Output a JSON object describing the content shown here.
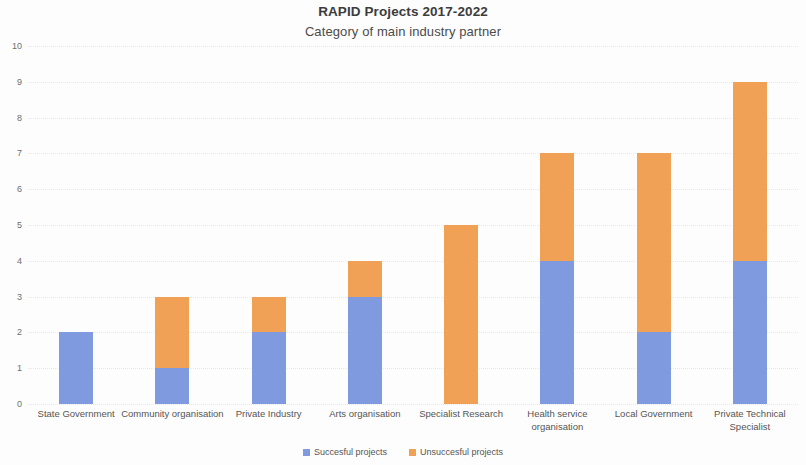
{
  "chart_data": {
    "type": "bar",
    "title": "RAPID Projects 2017-2022",
    "subtitle": "Category of main industry partner",
    "xlabel": "",
    "ylabel": "",
    "ylim": [
      0,
      10
    ],
    "ytick_labels": [
      "10",
      "9",
      "8",
      "7",
      "6",
      "5",
      "4",
      "3",
      "2",
      "1",
      "0"
    ],
    "ytick_values": [
      10,
      9,
      8,
      7,
      6,
      5,
      4,
      3,
      2,
      1,
      0
    ],
    "grid": true,
    "grid_axis": "y",
    "stacked": true,
    "legend_position": "bottom",
    "categories": [
      "State Government",
      "Community organisation",
      "Private Industry",
      "Arts organisation",
      "Specialist Research",
      "Health service organisation",
      "Local Government",
      "Private Technical Specialist"
    ],
    "series": [
      {
        "name": "Succesful projects",
        "color": "#7f9ade",
        "values": [
          2,
          1,
          2,
          3,
          0,
          4,
          2,
          4
        ]
      },
      {
        "name": "Unsuccesful projects",
        "color": "#f0a155",
        "values": [
          0,
          2,
          1,
          1,
          5,
          3,
          5,
          5
        ]
      }
    ],
    "totals": [
      2,
      3,
      3,
      4,
      5,
      7,
      7,
      9
    ]
  },
  "legend": {
    "items": [
      {
        "label": "Succesful projects",
        "color": "#7f9ade"
      },
      {
        "label": "Unsuccesful projects",
        "color": "#f0a155"
      }
    ]
  }
}
